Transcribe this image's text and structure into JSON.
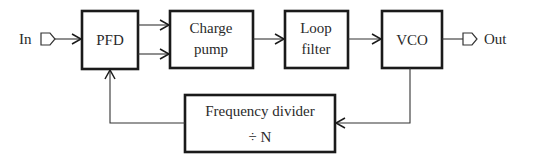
{
  "diagram": {
    "input_label": "In",
    "output_label": "Out",
    "blocks": [
      {
        "id": "pfd",
        "lines": [
          "PFD"
        ]
      },
      {
        "id": "charge_pump",
        "lines": [
          "Charge",
          "pump"
        ]
      },
      {
        "id": "loop_filter",
        "lines": [
          "Loop",
          "filter"
        ]
      },
      {
        "id": "vco",
        "lines": [
          "VCO"
        ]
      },
      {
        "id": "freq_divider",
        "lines": [
          "Frequency divider",
          "÷ N"
        ]
      }
    ],
    "connections": [
      {
        "from": "In",
        "to": "PFD"
      },
      {
        "from": "PFD",
        "to": "Charge pump",
        "count": 2
      },
      {
        "from": "Charge pump",
        "to": "Loop filter"
      },
      {
        "from": "Loop filter",
        "to": "VCO"
      },
      {
        "from": "VCO",
        "to": "Out"
      },
      {
        "from": "VCO",
        "to": "Frequency divider"
      },
      {
        "from": "Frequency divider",
        "to": "PFD"
      }
    ],
    "colors": {
      "stroke": "#1a1a1a",
      "background": "#ffffff",
      "text": "#2a2a2a"
    }
  }
}
